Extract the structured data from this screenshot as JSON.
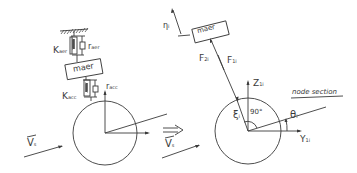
{
  "left_diagram": {
    "spring_top": {
      "k_label": "K",
      "k_sub": "aer",
      "r_label": "r",
      "r_sub": "aer"
    },
    "mass_box": {
      "label": "maer"
    },
    "spring_bottom": {
      "k_label": "K",
      "k_sub": "acc",
      "r_label": "r",
      "r_sub": "acc"
    },
    "velocity": {
      "label": "V",
      "sub": "s"
    }
  },
  "transition": {
    "arrow": "⟹",
    "velocity": {
      "label": "V",
      "sub": "s"
    }
  },
  "right_diagram": {
    "offset_label": {
      "label": "η",
      "sub": "i"
    },
    "mass_box": {
      "label": "maer"
    },
    "forces": [
      {
        "label": "F",
        "sub": "2i"
      },
      {
        "label": "F",
        "sub": "1i"
      }
    ],
    "z_axis": {
      "label": "Z",
      "sub": "1i"
    },
    "y_axis": {
      "label": "Y",
      "sub": "1i"
    },
    "xi_label": {
      "label": "ξ",
      "sub": "i"
    },
    "angle_right": {
      "label": "90°"
    },
    "theta": {
      "label": "θ",
      "sub": "i"
    },
    "section_label": "node section"
  },
  "colors": {
    "stroke": "#3a3a3a",
    "background": "#ffffff"
  }
}
